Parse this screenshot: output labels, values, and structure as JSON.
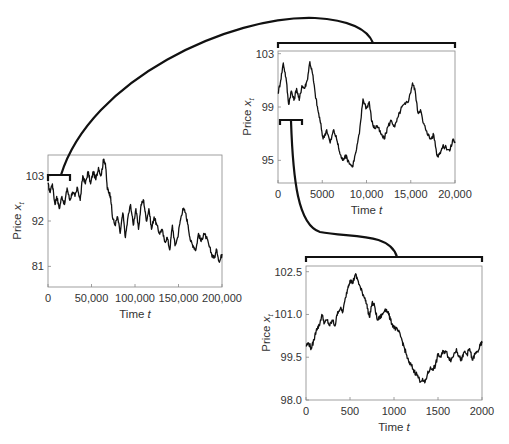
{
  "chart_data": [
    {
      "id": "long",
      "type": "line",
      "title": "",
      "xlabel": "Time t",
      "ylabel": "Price x_t",
      "xlim": [
        0,
        200000
      ],
      "ylim": [
        76,
        108
      ],
      "xticks": [
        0,
        50000,
        100000,
        150000,
        200000
      ],
      "xtick_labels": [
        "0",
        "50,000",
        "100,000",
        "150,000",
        "200,000"
      ],
      "yticks": [
        103,
        92,
        81
      ],
      "ytick_labels": [
        "103",
        "92",
        "81"
      ],
      "grid": false,
      "box": {
        "x": 48,
        "y": 155,
        "w": 174,
        "h": 132
      },
      "zoom_bracket": {
        "x0": 0,
        "x1": 25000,
        "note": "region magnified in medium chart"
      },
      "series": [
        {
          "name": "price",
          "x": [
            0,
            2000,
            5000,
            8000,
            10000,
            13000,
            16000,
            19000,
            22000,
            25000,
            28000,
            31000,
            34000,
            37000,
            40000,
            43000,
            46000,
            49000,
            52000,
            55000,
            58000,
            61000,
            64000,
            66000,
            68000,
            70000,
            72000,
            74000,
            77000,
            80000,
            83000,
            86000,
            89000,
            92000,
            95000,
            98000,
            101000,
            104000,
            107000,
            110000,
            113000,
            116000,
            119000,
            122000,
            125000,
            128000,
            131000,
            134000,
            137000,
            140000,
            143000,
            146000,
            149000,
            152000,
            155000,
            158000,
            161000,
            164000,
            167000,
            170000,
            173000,
            176000,
            179000,
            182000,
            185000,
            188000,
            191000,
            194000,
            197000,
            200000
          ],
          "values": [
            101,
            99,
            101,
            96,
            98,
            95,
            98,
            96,
            100,
            97,
            99,
            98,
            100,
            97,
            103,
            101,
            104,
            101,
            104,
            102,
            105,
            103,
            107,
            106,
            100,
            99,
            98,
            93,
            91,
            93,
            89,
            94,
            88,
            93,
            96,
            91,
            95,
            90,
            96,
            97,
            92,
            95,
            90,
            93,
            91,
            89,
            90,
            87,
            88,
            85,
            91,
            86,
            88,
            92,
            95,
            94,
            91,
            87,
            86,
            85,
            89,
            87,
            89,
            88,
            86,
            84,
            83,
            85,
            82,
            84
          ]
        }
      ]
    },
    {
      "id": "medium",
      "type": "line",
      "title": "",
      "xlabel": "Time t",
      "ylabel": "Price x_t",
      "xlim": [
        0,
        20000
      ],
      "ylim": [
        93.3,
        103.2
      ],
      "xticks": [
        0,
        5000,
        10000,
        15000,
        20000
      ],
      "xtick_labels": [
        "0",
        "5000",
        "10,000",
        "15,000",
        "20,000"
      ],
      "yticks": [
        103,
        99,
        95
      ],
      "ytick_labels": [
        "103",
        "99",
        "95"
      ],
      "grid": false,
      "box": {
        "x": 278,
        "y": 51,
        "w": 177,
        "h": 132
      },
      "zoom_bracket": {
        "x0": 0,
        "x1": 2000,
        "note": "region magnified in short chart"
      },
      "series": [
        {
          "name": "price",
          "x": [
            0,
            300,
            600,
            900,
            1200,
            1500,
            1800,
            2100,
            2400,
            2700,
            3000,
            3300,
            3600,
            3900,
            4200,
            4500,
            4800,
            5100,
            5500,
            5900,
            6300,
            6700,
            7000,
            7300,
            7600,
            8000,
            8400,
            8800,
            9200,
            9600,
            10000,
            10300,
            10600,
            10900,
            11200,
            11600,
            12000,
            12400,
            12800,
            13200,
            13600,
            14000,
            14400,
            14800,
            15200,
            15500,
            15800,
            16100,
            16400,
            16800,
            17200,
            17600,
            18000,
            18300,
            18600,
            19000,
            19400,
            19800,
            20000
          ],
          "values": [
            100,
            101,
            102.3,
            101.2,
            99.2,
            100.2,
            99.5,
            100.4,
            99.5,
            100.6,
            100.4,
            101,
            102.4,
            101.5,
            100,
            98.8,
            97.8,
            96.6,
            97.3,
            96.3,
            97.3,
            96.4,
            95.5,
            95,
            95.4,
            94.9,
            94.5,
            95.6,
            97,
            99.6,
            98.9,
            99.4,
            97.9,
            97.4,
            97.6,
            97,
            96.6,
            97.5,
            98,
            97.5,
            98.3,
            99,
            99.2,
            99.6,
            100.8,
            100.2,
            98.6,
            98.8,
            97.8,
            97.2,
            96.6,
            96.9,
            95.3,
            95.6,
            96,
            96,
            95.7,
            96.6,
            96.3
          ]
        }
      ]
    },
    {
      "id": "short",
      "type": "line",
      "title": "",
      "xlabel": "Time t",
      "ylabel": "Price x_t",
      "xlim": [
        0,
        2000
      ],
      "ylim": [
        98.0,
        102.7
      ],
      "xticks": [
        0,
        500,
        1000,
        1500,
        2000
      ],
      "xtick_labels": [
        "0",
        "500",
        "1000",
        "1500",
        "2000"
      ],
      "yticks": [
        102.5,
        101.0,
        99.5,
        98.0
      ],
      "ytick_labels": [
        "102.5",
        "101.0",
        "99.5",
        "98.0"
      ],
      "grid": false,
      "box": {
        "x": 306,
        "y": 266,
        "w": 176,
        "h": 134
      },
      "series": [
        {
          "name": "price",
          "x": [
            0,
            30,
            60,
            90,
            120,
            150,
            180,
            210,
            240,
            270,
            300,
            330,
            360,
            390,
            420,
            450,
            480,
            500,
            530,
            560,
            590,
            620,
            650,
            680,
            700,
            720,
            750,
            780,
            810,
            840,
            870,
            900,
            930,
            960,
            990,
            1020,
            1050,
            1080,
            1110,
            1140,
            1170,
            1200,
            1230,
            1260,
            1290,
            1320,
            1350,
            1380,
            1410,
            1440,
            1470,
            1500,
            1530,
            1560,
            1590,
            1620,
            1650,
            1680,
            1710,
            1740,
            1770,
            1800,
            1830,
            1860,
            1890,
            1920,
            1950,
            1980,
            2000
          ],
          "values": [
            99.9,
            100,
            99.8,
            100.1,
            100.5,
            100.6,
            101,
            100.7,
            100.8,
            100.6,
            100.8,
            100.6,
            101.1,
            101.2,
            101.1,
            101.6,
            102,
            102.2,
            102.1,
            102.4,
            102.2,
            101.9,
            101.7,
            101.5,
            101.2,
            100.9,
            101.4,
            101.3,
            100.8,
            100.9,
            101,
            101.2,
            101.1,
            100.8,
            100.6,
            100.5,
            100.4,
            100.2,
            99.9,
            99.6,
            99.3,
            99.2,
            99,
            98.9,
            98.7,
            98.7,
            98.6,
            98.9,
            99.1,
            99.1,
            99.2,
            99.6,
            99.5,
            99.7,
            99.7,
            99.5,
            99.4,
            99.6,
            99.8,
            99.5,
            99.4,
            99.7,
            99.6,
            99.8,
            99.4,
            99.6,
            99.7,
            99.9,
            100
          ]
        }
      ]
    }
  ],
  "annotations": {
    "connector_long_to_medium": "Curved line from bracket over t=0–25,000 on long chart to bracket above medium chart",
    "connector_medium_to_short": "Curved line from bracket over t=0–2000 on medium chart to bracket above short chart"
  },
  "colors": {
    "trace": "#111111",
    "frame": "#888888",
    "text": "#333333",
    "background": "#ffffff"
  }
}
